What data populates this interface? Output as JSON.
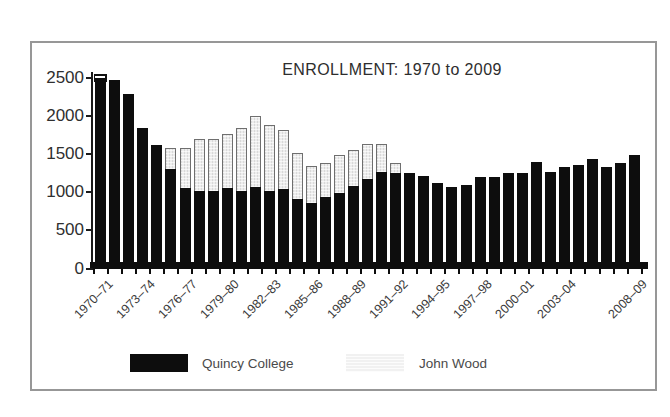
{
  "title": "ENROLLMENT: 1970 to 2009",
  "legend": {
    "series1": "Quincy College",
    "series2": "John Wood"
  },
  "colors": {
    "quincy_bar": "#0d0d0d",
    "john_wood_bar": "#ededed",
    "john_wood_border": "#6f6f6f",
    "frame_border": "#979797",
    "text": "#2f2f2f"
  },
  "chart_data": {
    "type": "bar",
    "stacked": true,
    "title": "ENROLLMENT: 1970 to 2009",
    "xlabel": "",
    "ylabel": "",
    "ylim": [
      0,
      2500
    ],
    "yticks": [
      0,
      500,
      1000,
      1500,
      2000,
      2500
    ],
    "grid": false,
    "legend_position": "bottom",
    "categories": [
      "1970–71",
      "1971–72",
      "1972–73",
      "1973–74",
      "1974–75",
      "1975–76",
      "1976–77",
      "1977–78",
      "1978–79",
      "1979–80",
      "1980–81",
      "1981–82",
      "1982–83",
      "1983–84",
      "1984–85",
      "1985–86",
      "1986–87",
      "1987–88",
      "1988–89",
      "1989–90",
      "1990–91",
      "1991–92",
      "1992–93",
      "1993–94",
      "1994–95",
      "1995–96",
      "1996–97",
      "1997–98",
      "1998–99",
      "1999–00",
      "2000–01",
      "2001–02",
      "2002–03",
      "2003–04",
      "2004–05",
      "2005–06",
      "2006–07",
      "2007–08",
      "2008–09"
    ],
    "x_label_indices": [
      0,
      3,
      6,
      9,
      12,
      15,
      18,
      21,
      24,
      27,
      30,
      33,
      38
    ],
    "series": [
      {
        "name": "Quincy College",
        "values": [
          2450,
          2430,
          2250,
          1800,
          1570,
          1260,
          1015,
          970,
          970,
          1005,
          965,
          1030,
          975,
          1000,
          860,
          820,
          895,
          950,
          1040,
          1125,
          1225,
          1205,
          1205,
          1170,
          1075,
          1030,
          1050,
          1160,
          1150,
          1205,
          1210,
          1350,
          1220,
          1290,
          1310,
          1390,
          1280,
          1345,
          1450
        ]
      },
      {
        "name": "John Wood",
        "values": [
          0,
          0,
          0,
          0,
          0,
          270,
          525,
          685,
          690,
          710,
          835,
          925,
          860,
          770,
          605,
          480,
          450,
          495,
          470,
          465,
          365,
          130,
          0,
          0,
          0,
          0,
          0,
          0,
          0,
          0,
          0,
          0,
          0,
          0,
          0,
          0,
          0,
          0,
          0
        ]
      }
    ]
  }
}
